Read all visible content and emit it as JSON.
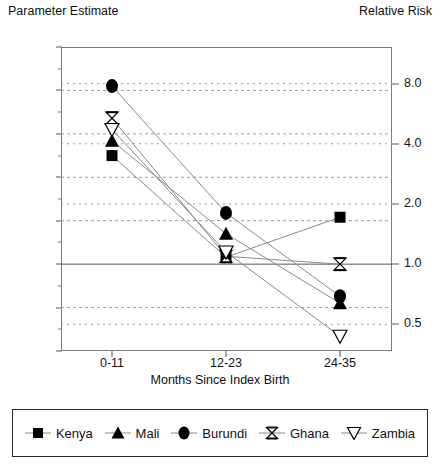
{
  "labels": {
    "left_axis_title": "Parameter Estimate",
    "right_axis_title": "Relative Risk",
    "x_axis_label": "Months Since Index Birth"
  },
  "legend": {
    "items": [
      {
        "label": "Kenya",
        "marker": "filled-square-icon"
      },
      {
        "label": "Mali",
        "marker": "filled-triangle-up-icon"
      },
      {
        "label": "Burundi",
        "marker": "filled-circle-icon"
      },
      {
        "label": "Ghana",
        "marker": "hourglass-icon"
      },
      {
        "label": "Zambia",
        "marker": "open-triangle-down-icon"
      }
    ]
  },
  "chart_data": {
    "type": "line",
    "title": "",
    "xlabel": "Months Since Index Birth",
    "ylabel": "Parameter Estimate",
    "y2label": "Relative Risk",
    "categories": [
      "0-11",
      "12-23",
      "24-35"
    ],
    "ylim": [
      -1,
      2.5
    ],
    "yticks": [
      2.5,
      2,
      1.5,
      1,
      0.5,
      0,
      -0.5,
      -1
    ],
    "ytick_labels": [
      "2.5",
      "2",
      "1.5",
      "1",
      "0.5",
      "0",
      "-0.5",
      "-1"
    ],
    "y2_ticks_param": [
      2.079,
      1.386,
      0.693,
      0,
      -0.693
    ],
    "y2_tick_labels": [
      "8.0",
      "4.0",
      "2.0",
      "1.0",
      "0.5"
    ],
    "grid": true,
    "grid_style": "dashed-horizontal",
    "legend_position": "below-plot",
    "series": [
      {
        "name": "Kenya",
        "marker": "filled-square",
        "values": [
          1.25,
          0.08,
          0.54
        ]
      },
      {
        "name": "Mali",
        "marker": "filled-triangle-up",
        "values": [
          1.42,
          0.35,
          -0.45
        ]
      },
      {
        "name": "Burundi",
        "marker": "filled-circle",
        "values": [
          2.05,
          0.59,
          -0.37
        ]
      },
      {
        "name": "Ghana",
        "marker": "hourglass",
        "values": [
          1.68,
          0.09,
          0.0
        ]
      },
      {
        "name": "Zambia",
        "marker": "open-triangle-down",
        "values": [
          1.55,
          0.14,
          -0.83
        ]
      }
    ]
  },
  "colors": {
    "line": "#8a8a8a",
    "marker": "#000000",
    "frame": "#7b7b7b",
    "grid": "#9a9a9a",
    "zero_line": "#555555"
  }
}
